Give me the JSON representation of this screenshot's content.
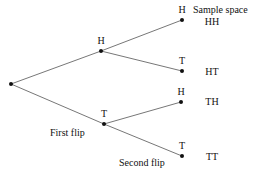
{
  "diagram": {
    "type": "probability-tree",
    "header": "Sample space",
    "root": {
      "x": 11,
      "y": 84
    },
    "first_level": [
      {
        "id": "H",
        "label": "H",
        "x": 101,
        "y": 51
      },
      {
        "id": "T",
        "label": "T",
        "x": 104,
        "y": 124
      }
    ],
    "second_level": [
      {
        "parent": "H",
        "label": "H",
        "x": 182,
        "y": 20,
        "outcome": "HH"
      },
      {
        "parent": "H",
        "label": "T",
        "x": 182,
        "y": 71,
        "outcome": "HT"
      },
      {
        "parent": "T",
        "label": "H",
        "x": 181,
        "y": 102,
        "outcome": "TH"
      },
      {
        "parent": "T",
        "label": "T",
        "x": 182,
        "y": 156,
        "outcome": "TT"
      }
    ],
    "stage_labels": {
      "first": "First flip",
      "second": "Second flip"
    },
    "colors": {
      "edge": "#777777",
      "node": "#111111",
      "text": "#111111"
    }
  }
}
